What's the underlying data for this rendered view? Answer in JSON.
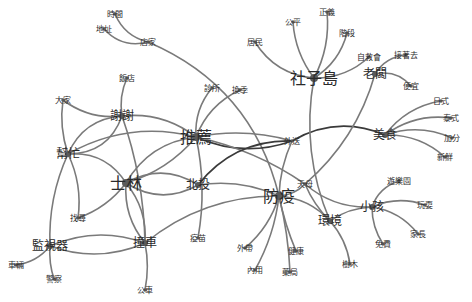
{
  "diagram": {
    "type": "word-cooccurrence-network",
    "edge_color": "#7a7a7a",
    "dark_edge_color": "#3a3a3a",
    "node_color": "#5a5a5a",
    "nodes": [
      {
        "label": "時間",
        "x": 115,
        "y": 14,
        "size": "sm"
      },
      {
        "label": "地址",
        "x": 104,
        "y": 29,
        "size": "sm"
      },
      {
        "label": "店家",
        "x": 148,
        "y": 42,
        "size": "sm"
      },
      {
        "label": "飯店",
        "x": 127,
        "y": 78,
        "size": "sm"
      },
      {
        "label": "大家",
        "x": 63,
        "y": 100,
        "size": "sm"
      },
      {
        "label": "謝謝",
        "x": 122,
        "y": 116,
        "size": "md"
      },
      {
        "label": "推薦",
        "x": 196,
        "y": 137,
        "size": "lg"
      },
      {
        "label": "診所",
        "x": 212,
        "y": 88,
        "size": "sm"
      },
      {
        "label": "換季",
        "x": 240,
        "y": 90,
        "size": "sm"
      },
      {
        "label": "社子島",
        "x": 314,
        "y": 78,
        "size": "lg"
      },
      {
        "label": "居民",
        "x": 255,
        "y": 42,
        "size": "sm"
      },
      {
        "label": "公平",
        "x": 293,
        "y": 22,
        "size": "sm"
      },
      {
        "label": "正義",
        "x": 327,
        "y": 12,
        "size": "sm"
      },
      {
        "label": "階段",
        "x": 347,
        "y": 33,
        "size": "sm"
      },
      {
        "label": "自救會",
        "x": 369,
        "y": 57,
        "size": "sm"
      },
      {
        "label": "老闆",
        "x": 375,
        "y": 74,
        "size": "md"
      },
      {
        "label": "接著去",
        "x": 406,
        "y": 55,
        "size": "sm"
      },
      {
        "label": "便宜",
        "x": 411,
        "y": 86,
        "size": "sm"
      },
      {
        "label": "美食",
        "x": 385,
        "y": 135,
        "size": "md"
      },
      {
        "label": "日式",
        "x": 441,
        "y": 101,
        "size": "sm"
      },
      {
        "label": "泰式",
        "x": 451,
        "y": 118,
        "size": "sm"
      },
      {
        "label": "加分",
        "x": 452,
        "y": 138,
        "size": "sm"
      },
      {
        "label": "新鮮",
        "x": 445,
        "y": 157,
        "size": "sm"
      },
      {
        "label": "外送",
        "x": 292,
        "y": 141,
        "size": "sm"
      },
      {
        "label": "幫忙",
        "x": 68,
        "y": 154,
        "size": "md"
      },
      {
        "label": "士林",
        "x": 126,
        "y": 183,
        "size": "lg"
      },
      {
        "label": "北投",
        "x": 198,
        "y": 185,
        "size": "md"
      },
      {
        "label": "防疫",
        "x": 279,
        "y": 196,
        "size": "lg"
      },
      {
        "label": "天母",
        "x": 305,
        "y": 184,
        "size": "sm"
      },
      {
        "label": "小孩",
        "x": 372,
        "y": 207,
        "size": "md"
      },
      {
        "label": "遊樂園",
        "x": 399,
        "y": 181,
        "size": "sm"
      },
      {
        "label": "玩耍",
        "x": 425,
        "y": 205,
        "size": "sm"
      },
      {
        "label": "家長",
        "x": 418,
        "y": 234,
        "size": "sm"
      },
      {
        "label": "免費",
        "x": 383,
        "y": 244,
        "size": "sm"
      },
      {
        "label": "環境",
        "x": 330,
        "y": 221,
        "size": "md"
      },
      {
        "label": "樹木",
        "x": 350,
        "y": 264,
        "size": "sm"
      },
      {
        "label": "找尋",
        "x": 78,
        "y": 218,
        "size": "sm"
      },
      {
        "label": "監視器",
        "x": 50,
        "y": 246,
        "size": "md"
      },
      {
        "label": "車輛",
        "x": 16,
        "y": 265,
        "size": "sm"
      },
      {
        "label": "警察",
        "x": 54,
        "y": 279,
        "size": "sm"
      },
      {
        "label": "撞車",
        "x": 145,
        "y": 243,
        "size": "md"
      },
      {
        "label": "公車",
        "x": 145,
        "y": 290,
        "size": "sm"
      },
      {
        "label": "疫苗",
        "x": 198,
        "y": 238,
        "size": "sm"
      },
      {
        "label": "外帶",
        "x": 245,
        "y": 248,
        "size": "sm"
      },
      {
        "label": "內用",
        "x": 255,
        "y": 270,
        "size": "sm"
      },
      {
        "label": "健康",
        "x": 296,
        "y": 251,
        "size": "sm"
      },
      {
        "label": "藥局",
        "x": 290,
        "y": 272,
        "size": "sm"
      }
    ],
    "edges": [
      {
        "s": "時間",
        "t": "店家",
        "c": 0.25
      },
      {
        "s": "地址",
        "t": "店家",
        "c": 0.3
      },
      {
        "s": "店家",
        "t": "防疫",
        "c": -0.25
      },
      {
        "s": "飯店",
        "t": "謝謝",
        "c": 0.15
      },
      {
        "s": "大家",
        "t": "謝謝",
        "c": 0.2
      },
      {
        "s": "大家",
        "t": "幫忙",
        "c": 0.12
      },
      {
        "s": "謝謝",
        "t": "幫忙",
        "c": 0.3
      },
      {
        "s": "幫忙",
        "t": "謝謝",
        "c": 0.35
      },
      {
        "s": "謝謝",
        "t": "推薦",
        "c": -0.2
      },
      {
        "s": "謝謝",
        "t": "撞車",
        "c": -0.08
      },
      {
        "s": "幫忙",
        "t": "推薦",
        "c": -0.2
      },
      {
        "s": "幫忙",
        "t": "找尋",
        "c": -0.15
      },
      {
        "s": "幫忙",
        "t": "監視器",
        "c": 0.12
      },
      {
        "s": "幫忙",
        "t": "士林",
        "c": -0.3
      },
      {
        "s": "士林",
        "t": "北投",
        "c": 0.3
      },
      {
        "s": "士林",
        "t": "北投",
        "c": -0.3
      },
      {
        "s": "士林",
        "t": "推薦",
        "c": 0.15
      },
      {
        "s": "士林",
        "t": "推薦",
        "c": -0.25
      },
      {
        "s": "士林",
        "t": "撞車",
        "c": 0.2
      },
      {
        "s": "士林",
        "t": "撞車",
        "c": -0.2
      },
      {
        "s": "士林",
        "t": "找尋",
        "c": -0.15
      },
      {
        "s": "推薦",
        "t": "診所",
        "c": -0.2
      },
      {
        "s": "推薦",
        "t": "換季",
        "c": -0.2
      },
      {
        "s": "推薦",
        "t": "外送",
        "c": -0.12
      },
      {
        "s": "推薦",
        "t": "外送",
        "c": 0.2,
        "dark": true
      },
      {
        "s": "推薦",
        "t": "天母",
        "c": -0.1
      },
      {
        "s": "推薦",
        "t": "疫苗",
        "c": -0.1
      },
      {
        "s": "北投",
        "t": "外送",
        "c": -0.25,
        "dark": true
      },
      {
        "s": "北投",
        "t": "防疫",
        "c": -0.15
      },
      {
        "s": "外送",
        "t": "美食",
        "c": -0.25,
        "dark": true
      },
      {
        "s": "外送",
        "t": "防疫",
        "c": 0.1
      },
      {
        "s": "監視器",
        "t": "撞車",
        "c": -0.2
      },
      {
        "s": "監視器",
        "t": "撞車",
        "c": 0.2
      },
      {
        "s": "監視器",
        "t": "車輛",
        "c": -0.2
      },
      {
        "s": "監視器",
        "t": "警察",
        "c": 0.1
      },
      {
        "s": "撞車",
        "t": "公車",
        "c": -0.1
      },
      {
        "s": "撞車",
        "t": "防疫",
        "c": -0.18
      },
      {
        "s": "社子島",
        "t": "居民",
        "c": -0.25
      },
      {
        "s": "社子島",
        "t": "公平",
        "c": -0.15
      },
      {
        "s": "社子島",
        "t": "正義",
        "c": 0.15
      },
      {
        "s": "社子島",
        "t": "階段",
        "c": 0.2
      },
      {
        "s": "社子島",
        "t": "自救會",
        "c": 0.2
      },
      {
        "s": "社子島",
        "t": "環境",
        "c": 0.15
      },
      {
        "s": "老闆",
        "t": "接著去",
        "c": -0.25
      },
      {
        "s": "老闆",
        "t": "便宜",
        "c": -0.3
      },
      {
        "s": "老闆",
        "t": "天母",
        "c": -0.15
      },
      {
        "s": "美食",
        "t": "日式",
        "c": -0.2
      },
      {
        "s": "美食",
        "t": "泰式",
        "c": -0.2
      },
      {
        "s": "美食",
        "t": "加分",
        "c": -0.2
      },
      {
        "s": "美食",
        "t": "新鮮",
        "c": -0.2
      },
      {
        "s": "防疫",
        "t": "外帶",
        "c": -0.15
      },
      {
        "s": "防疫",
        "t": "內用",
        "c": -0.1
      },
      {
        "s": "防疫",
        "t": "健康",
        "c": 0.05
      },
      {
        "s": "防疫",
        "t": "藥局",
        "c": -0.05
      },
      {
        "s": "防疫",
        "t": "天母",
        "c": 0.2
      },
      {
        "s": "防疫",
        "t": "環境",
        "c": -0.2
      },
      {
        "s": "天母",
        "t": "小孩",
        "c": 0.2
      },
      {
        "s": "天母",
        "t": "環境",
        "c": 0.1
      },
      {
        "s": "環境",
        "t": "小孩",
        "c": -0.15
      },
      {
        "s": "環境",
        "t": "樹木",
        "c": -0.15
      },
      {
        "s": "小孩",
        "t": "遊樂園",
        "c": -0.25
      },
      {
        "s": "小孩",
        "t": "玩耍",
        "c": -0.2
      },
      {
        "s": "小孩",
        "t": "家長",
        "c": -0.2
      },
      {
        "s": "小孩",
        "t": "免費",
        "c": 0.15
      }
    ]
  }
}
